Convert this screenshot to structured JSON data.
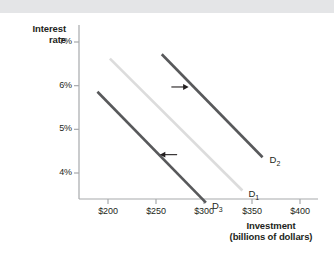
{
  "figure": {
    "background": "#ffffff",
    "top_band_color": "#e4e5e7"
  },
  "axes": {
    "y_title_line1": "Interest",
    "y_title_line2": "rate",
    "x_title_line1": "Investment",
    "x_title_line2": "(billions of dollars)",
    "axis_color": "#a7a9ac"
  },
  "curve_labels": {
    "d1_base": "D",
    "d1_sub": "1",
    "d2_base": "D",
    "d2_sub": "2",
    "d3_base": "D",
    "d3_sub": "3"
  },
  "chart_data": {
    "type": "line",
    "title": "",
    "xlabel": "Investment (billions of dollars)",
    "ylabel": "Interest rate",
    "xlim": [
      165,
      420
    ],
    "ylim": [
      3.1,
      7.25
    ],
    "grid": false,
    "legend": "inline-curve-labels",
    "xticks": [
      200,
      250,
      300,
      350,
      400
    ],
    "xticklabels": [
      "$200",
      "$250",
      "$300",
      "$350",
      "$400"
    ],
    "yticks": [
      4,
      5,
      6,
      7
    ],
    "yticklabels": [
      "4%",
      "5%",
      "6%",
      "7%"
    ],
    "series": [
      {
        "name": "D1",
        "label": "D1",
        "color": "#dcdcdc",
        "x": [
          202,
          340
        ],
        "y": [
          6.62,
          3.6
        ]
      },
      {
        "name": "D2",
        "label": "D2",
        "color": "#58595b",
        "x": [
          256,
          361
        ],
        "y": [
          6.72,
          4.36
        ]
      },
      {
        "name": "D3",
        "label": "D3",
        "color": "#58595b",
        "x": [
          189,
          302
        ],
        "y": [
          5.86,
          3.32
        ]
      }
    ],
    "annotations": [
      {
        "name": "rightward-shift-arrow",
        "direction": "right",
        "x_start": 266,
        "x_end": 284,
        "y": 5.97,
        "meaning": "shift from D1 to D2"
      },
      {
        "name": "leftward-shift-arrow",
        "direction": "left",
        "x_start": 272,
        "x_end": 254,
        "y": 4.42,
        "meaning": "shift from D1 to D3"
      }
    ]
  }
}
